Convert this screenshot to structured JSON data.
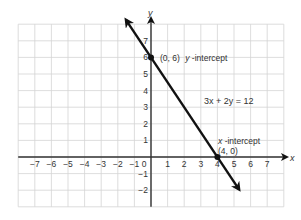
{
  "chart_data": {
    "type": "line",
    "title": "",
    "equation": "3x + 2y = 12",
    "xlabel": "x",
    "ylabel": "y",
    "xlim": [
      -8,
      8
    ],
    "ylim": [
      -3,
      8
    ],
    "grid": true,
    "x_ticks": [
      -7,
      -6,
      -5,
      -4,
      -3,
      -2,
      -1,
      0,
      1,
      2,
      3,
      4,
      5,
      6,
      7
    ],
    "y_ticks": [
      -2,
      -1,
      1,
      2,
      3,
      4,
      5,
      6,
      7
    ],
    "series": [
      {
        "name": "3x + 2y = 12",
        "x": [
          -1.5,
          0,
          4,
          5.3
        ],
        "y": [
          8.25,
          6,
          0,
          -1.95
        ]
      }
    ],
    "points": [
      {
        "x": 0,
        "y": 6,
        "label": "(0, 6)",
        "annotation": "y-intercept"
      },
      {
        "x": 4,
        "y": 0,
        "label": "(4, 0)",
        "annotation": "x-intercept"
      }
    ],
    "annotations": {
      "y_intercept": "(0, 6) y-intercept",
      "x_intercept_line1": "x-intercept",
      "x_intercept_line2": "(4, 0)",
      "equation_label": "3x + 2y = 12"
    }
  },
  "labels": {
    "x_axis": "x",
    "y_axis": "y",
    "y_intercept_coord": "(0, 6)",
    "y_intercept_text": "y",
    "y_intercept_suffix": "-intercept",
    "x_intercept_text": "x",
    "x_intercept_suffix": "-intercept",
    "x_intercept_coord": "(4, 0)",
    "equation": "3x + 2y = 12"
  }
}
